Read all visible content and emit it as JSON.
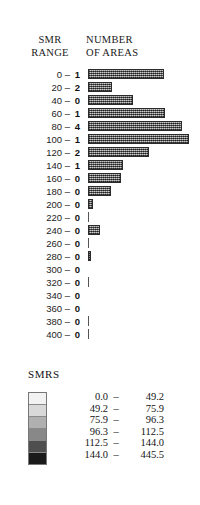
{
  "figure": {
    "headers": {
      "smr_range_line1": "SMR",
      "smr_range_line2": "RANGE",
      "number_line1": "NUMBER",
      "number_line2": "OF AREAS"
    },
    "legend": {
      "title": "SMRS",
      "dash": "–"
    }
  },
  "chart_data": {
    "type": "bar",
    "orientation": "horizontal",
    "title": "",
    "xlabel": "NUMBER OF AREAS",
    "ylabel": "SMR RANGE",
    "grid": false,
    "legend_position": "bottom",
    "categories": [
      "0 –",
      "20 –",
      "40 –",
      "60 –",
      "80 –",
      "100 –",
      "120 –",
      "140 –",
      "160 –",
      "180 –",
      "200 –",
      "220 –",
      "240 –",
      "260 –",
      "280 –",
      "300 –",
      "320 –",
      "340 –",
      "360 –",
      "380 –",
      "400 –"
    ],
    "count_labels": [
      "1",
      "2",
      "0",
      "1",
      "4",
      "1",
      "2",
      "1",
      "0",
      "0",
      "0",
      "0",
      "0",
      "0",
      "0",
      "0",
      "0",
      "0",
      "0",
      "0",
      "0"
    ],
    "values": [
      72,
      23,
      42,
      73,
      89,
      95,
      58,
      33,
      31,
      22,
      5,
      1,
      11,
      1,
      3,
      0,
      1,
      0,
      0,
      1,
      1
    ],
    "xlim": [
      0,
      100
    ],
    "ylim": [
      0,
      21
    ],
    "legend_entries": [
      {
        "lo": "0.0",
        "hi": "49.2",
        "shade": "#f2f2f2"
      },
      {
        "lo": "49.2",
        "hi": "75.9",
        "shade": "#d9d9d9"
      },
      {
        "lo": "75.9",
        "hi": "96.3",
        "shade": "#b0b0b0"
      },
      {
        "lo": "96.3",
        "hi": "112.5",
        "shade": "#888888"
      },
      {
        "lo": "112.5",
        "hi": "144.0",
        "shade": "#4f4f4f"
      },
      {
        "lo": "144.0",
        "hi": "445.5",
        "shade": "#1a1a1a"
      }
    ]
  }
}
